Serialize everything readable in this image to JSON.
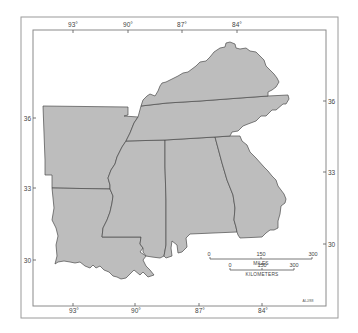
{
  "map": {
    "title": "",
    "states": [
      {
        "id": "kentucky",
        "name": "Kentucky"
      },
      {
        "id": "tennessee",
        "name": "Tennessee"
      },
      {
        "id": "arkansas",
        "name": "Arkansas"
      },
      {
        "id": "louisiana",
        "name": "Louisiana"
      },
      {
        "id": "mississippi",
        "name": "Mississippi"
      },
      {
        "id": "alabama",
        "name": "Alabama"
      },
      {
        "id": "georgia",
        "name": "Georgia"
      }
    ],
    "colors": {
      "land": "#bdbdbd",
      "border": "#4a4a4a",
      "frame": "#9a9a9a",
      "background": "#ffffff"
    },
    "longitude_ticks_top": [
      "93°",
      "90°",
      "87°",
      "84°"
    ],
    "longitude_ticks_bottom": [
      "93°",
      "90°",
      "87°",
      "84°"
    ],
    "latitude_ticks_left": [
      "36",
      "33",
      "30"
    ],
    "latitude_ticks_right": [
      "36",
      "33",
      "30"
    ],
    "scale_bar": {
      "miles": {
        "labels": [
          "0",
          "150",
          "300"
        ],
        "unit": "MILES"
      },
      "kilometers": {
        "labels": [
          "0",
          "150",
          "300"
        ],
        "unit": "KILOMETERS"
      }
    },
    "credit": "ALJ/88"
  }
}
